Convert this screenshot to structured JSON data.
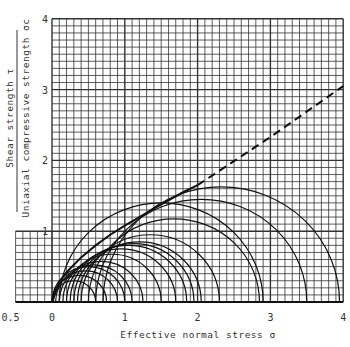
{
  "chart_data": {
    "type": "line",
    "title": "",
    "xlabel": "Effective normal stress σ",
    "ylabel_numerator": "Shear strength τ",
    "ylabel_denominator": "Uniaxial compressive strength σc",
    "xlim": [
      -0.5,
      4
    ],
    "ylim": [
      0,
      4
    ],
    "x_ticks": [
      "-0.5",
      "0",
      "1",
      "2",
      "3",
      "4"
    ],
    "y_ticks": [
      "1",
      "2",
      "3",
      "4"
    ],
    "grid": true,
    "grid_minor_step": 0.1,
    "grid_major_step": 1,
    "left_strip": {
      "x": [
        -0.5,
        0
      ],
      "y_max": 1
    },
    "failure_envelope": {
      "solid": {
        "x": [
          0,
          0.1,
          0.2,
          0.4,
          0.6,
          0.8,
          1.0,
          1.2,
          1.5,
          1.8,
          2.0
        ],
        "y": [
          0,
          0.28,
          0.42,
          0.63,
          0.8,
          0.95,
          1.08,
          1.2,
          1.38,
          1.55,
          1.65
        ]
      },
      "dashed": {
        "x": [
          2.0,
          2.5,
          3.0,
          3.5,
          4.0
        ],
        "y": [
          1.65,
          1.99,
          2.33,
          2.69,
          3.05
        ]
      }
    },
    "mohr_circles": [
      {
        "sigma3": 0.0,
        "sigma1": 0.6
      },
      {
        "sigma3": 0.0,
        "sigma1": 0.75
      },
      {
        "sigma3": 0.02,
        "sigma1": 0.9
      },
      {
        "sigma3": 0.05,
        "sigma1": 1.1
      },
      {
        "sigma3": 0.0,
        "sigma1": 1.0
      },
      {
        "sigma3": 0.1,
        "sigma1": 1.25
      },
      {
        "sigma3": 0.15,
        "sigma1": 1.5
      },
      {
        "sigma3": 0.2,
        "sigma1": 1.7
      },
      {
        "sigma3": 0.25,
        "sigma1": 1.85
      },
      {
        "sigma3": 0.3,
        "sigma1": 1.95
      },
      {
        "sigma3": 0.35,
        "sigma1": 2.05
      },
      {
        "sigma3": 0.4,
        "sigma1": 2.3
      },
      {
        "sigma3": 0.5,
        "sigma1": 2.85
      },
      {
        "sigma3": 0.6,
        "sigma1": 3.5
      },
      {
        "sigma3": 0.7,
        "sigma1": 3.95
      },
      {
        "sigma3": 0.1,
        "sigma1": 2.9
      }
    ],
    "series": [
      {
        "name": "Failure envelope (solid)",
        "style": "solid"
      },
      {
        "name": "Failure envelope (extrapolated)",
        "style": "dashed"
      },
      {
        "name": "Mohr circles",
        "style": "solid"
      }
    ]
  }
}
